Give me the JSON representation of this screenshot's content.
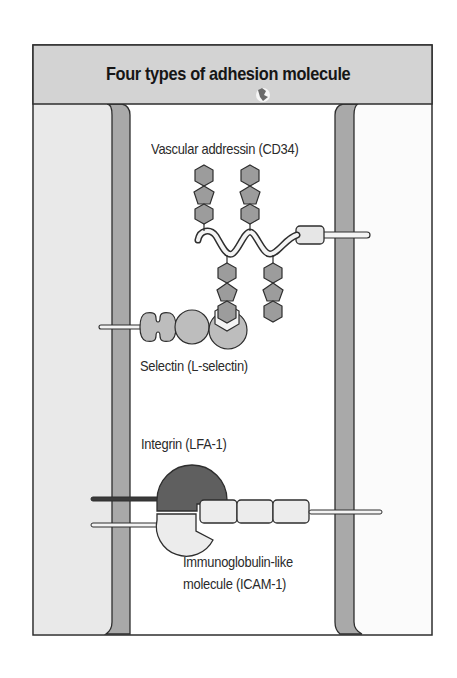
{
  "diagram": {
    "title": "Four types of adhesion molecule",
    "labels": {
      "vascular_addressin": "Vascular addressin (CD34)",
      "selectin": "Selectin (L-selectin)",
      "integrin": "Integrin (LFA-1)",
      "immunoglobulin_line1": "Immunoglobulin-like",
      "immunoglobulin_line2": "molecule (ICAM-1)"
    },
    "colors": {
      "header_fill": "#d3d3d3",
      "left_cell_fill": "#e9e9e9",
      "right_cell_fill": "#fbfbfb",
      "membrane_fill": "#a9a9a9",
      "hexagon_fill": "#9c9c9c",
      "selectin_fill": "#bdbdbd",
      "integrin_fill": "#5f5f5f",
      "icam_fill": "#ececec",
      "outline": "#2e2e2e"
    }
  }
}
